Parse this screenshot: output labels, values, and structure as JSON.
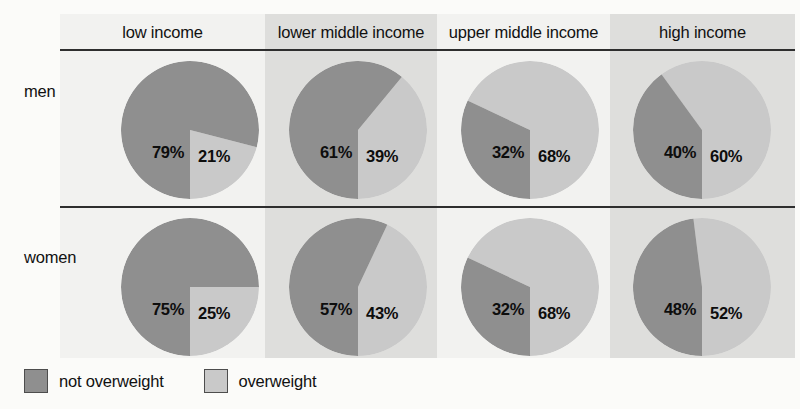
{
  "chart_data": {
    "type": "pie",
    "title": "",
    "subtitle": "",
    "xlabel": "",
    "ylabel": "",
    "grid": false,
    "legend_position": "bottom-left",
    "columns": [
      "low income",
      "lower middle income",
      "upper middle income",
      "high income"
    ],
    "rows": [
      "men",
      "women"
    ],
    "slice_labels": [
      "not overweight",
      "overweight"
    ],
    "colors": {
      "not_overweight": "#8f8f8f",
      "overweight": "#c9c9c9",
      "band_light": "#f2f2f0",
      "band_dark": "#dededc",
      "rule": "#2e2e2e",
      "text": "#0d0d0d"
    },
    "series": [
      {
        "name": "not overweight",
        "values": [
          79,
          61,
          32,
          40,
          75,
          57,
          32,
          48
        ]
      },
      {
        "name": "overweight",
        "values": [
          21,
          39,
          68,
          60,
          25,
          43,
          68,
          52
        ]
      }
    ],
    "cells": [
      {
        "row": "men",
        "column": "low income",
        "not_overweight": 79,
        "overweight": 21,
        "not_overweight_label": "79%",
        "overweight_label": "21%"
      },
      {
        "row": "men",
        "column": "lower middle income",
        "not_overweight": 61,
        "overweight": 39,
        "not_overweight_label": "61%",
        "overweight_label": "39%"
      },
      {
        "row": "men",
        "column": "upper middle income",
        "not_overweight": 32,
        "overweight": 68,
        "not_overweight_label": "32%",
        "overweight_label": "68%"
      },
      {
        "row": "men",
        "column": "high income",
        "not_overweight": 40,
        "overweight": 60,
        "not_overweight_label": "40%",
        "overweight_label": "60%"
      },
      {
        "row": "women",
        "column": "low income",
        "not_overweight": 75,
        "overweight": 25,
        "not_overweight_label": "75%",
        "overweight_label": "25%"
      },
      {
        "row": "women",
        "column": "lower middle income",
        "not_overweight": 57,
        "overweight": 43,
        "not_overweight_label": "57%",
        "overweight_label": "43%"
      },
      {
        "row": "women",
        "column": "upper middle income",
        "not_overweight": 32,
        "overweight": 68,
        "not_overweight_label": "32%",
        "overweight_label": "68%"
      },
      {
        "row": "women",
        "column": "high income",
        "not_overweight": 48,
        "overweight": 52,
        "not_overweight_label": "48%",
        "overweight_label": "52%"
      }
    ]
  },
  "header": {
    "columns": [
      {
        "label": "low income"
      },
      {
        "label": "lower middle income"
      },
      {
        "label": "upper middle income"
      },
      {
        "label": "high income"
      }
    ]
  },
  "rows": [
    {
      "label": "men"
    },
    {
      "label": "women"
    }
  ],
  "legend": {
    "items": [
      {
        "label": "not overweight",
        "color": "#8f8f8f"
      },
      {
        "label": "overweight",
        "color": "#c9c9c9"
      }
    ]
  }
}
